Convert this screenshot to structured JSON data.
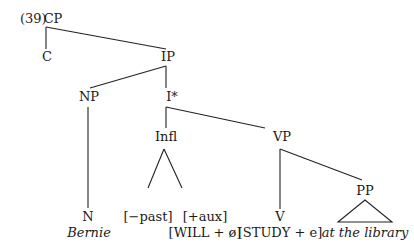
{
  "example_number": "(39)",
  "nodes": {
    "cp": "CP",
    "c": "C",
    "ip": "IP",
    "np": "NP",
    "istar": "I*",
    "infl": "Infl",
    "vp": "VP",
    "pp": "PP",
    "n": "N",
    "bernie": "Bernie",
    "past": "[−past]",
    "aux": "[+aux]",
    "will": "[WILL + ø]",
    "v": "V",
    "study": "[STUDY + e]",
    "library": "at the library"
  }
}
